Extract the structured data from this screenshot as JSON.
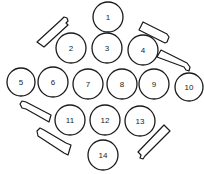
{
  "diagram": {
    "type": "numbered-circle-layout",
    "stroke_color": "#1a1a1a",
    "background": "#ffffff",
    "circles": [
      {
        "label": "1",
        "cx": 108,
        "cy": 17,
        "r": 15
      },
      {
        "label": "2",
        "cx": 71,
        "cy": 48,
        "r": 15
      },
      {
        "label": "3",
        "cx": 107,
        "cy": 48,
        "r": 15
      },
      {
        "label": "4",
        "cx": 143,
        "cy": 50,
        "r": 15
      },
      {
        "label": "5",
        "cx": 21,
        "cy": 82,
        "r": 14
      },
      {
        "label": "6",
        "cx": 53,
        "cy": 82,
        "r": 15
      },
      {
        "label": "7",
        "cx": 88,
        "cy": 84,
        "r": 15
      },
      {
        "label": "8",
        "cx": 122,
        "cy": 84,
        "r": 15
      },
      {
        "label": "9",
        "cx": 154,
        "cy": 84,
        "r": 15
      },
      {
        "label": "10",
        "cx": 189,
        "cy": 87,
        "r": 14
      },
      {
        "label": "11",
        "cx": 70,
        "cy": 120,
        "r": 15
      },
      {
        "label": "12",
        "cx": 105,
        "cy": 120,
        "r": 15
      },
      {
        "label": "13",
        "cx": 140,
        "cy": 121,
        "r": 15
      },
      {
        "label": "14",
        "cx": 103,
        "cy": 155,
        "r": 15
      }
    ],
    "tubes": [
      {
        "name": "tube-top-left"
      },
      {
        "name": "tube-top-right"
      },
      {
        "name": "tube-right"
      },
      {
        "name": "tube-left"
      },
      {
        "name": "tube-bottom-left"
      },
      {
        "name": "tube-bottom-right"
      }
    ]
  }
}
